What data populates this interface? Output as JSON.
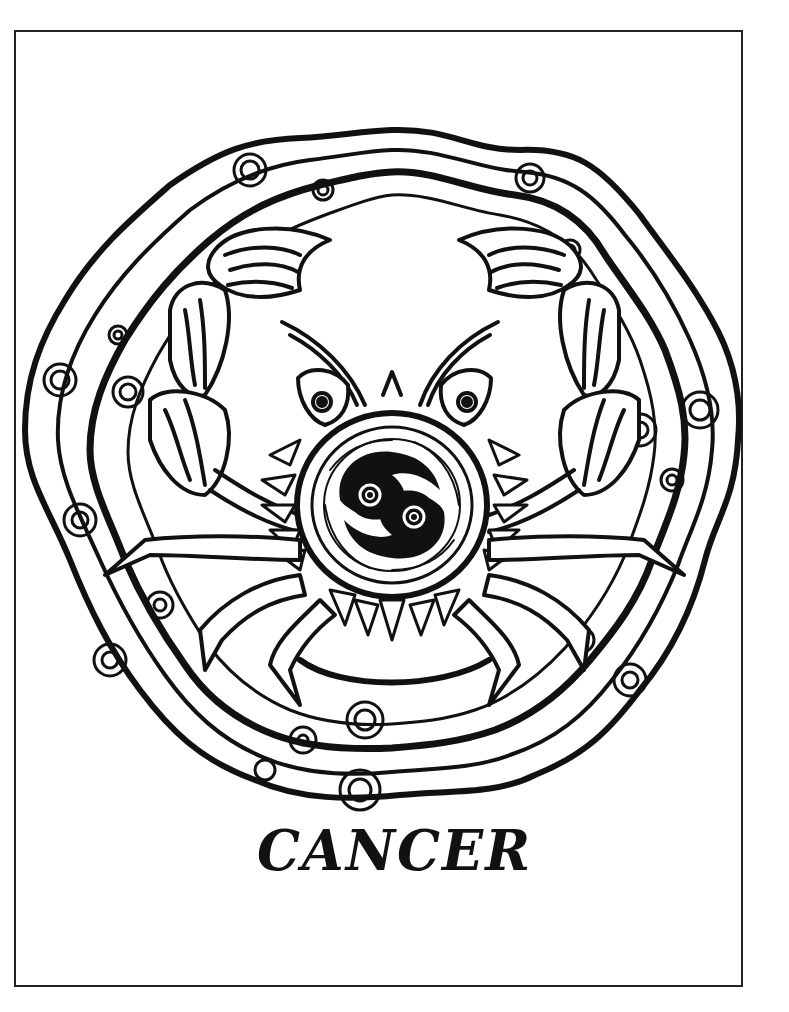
{
  "page": {
    "kind": "coloring-page",
    "title": "CANCER",
    "ink_color": "#111111",
    "paper_color": "#ffffff",
    "frame_color": "#222222"
  },
  "illustration": {
    "center_symbol": "cancer-zodiac-glyph",
    "elements": [
      "wavy-outer-rings",
      "spiral-ornaments",
      "crab-claws",
      "crab-eyes",
      "crab-legs",
      "leaf-fringe",
      "antennae"
    ]
  }
}
